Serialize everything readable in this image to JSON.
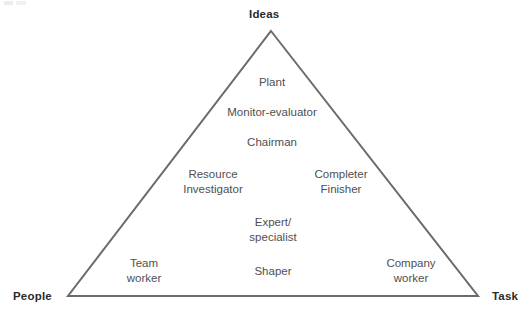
{
  "diagram": {
    "type": "triangle",
    "colors": {
      "background": "#ffffff",
      "line": "#6b6b6b",
      "vertex_label_text": "#2b2b2b",
      "role_label_text": "#4f4f4f"
    },
    "geometry": {
      "apex": [
        271,
        31
      ],
      "bottom_left": [
        68,
        296
      ],
      "bottom_right": [
        478,
        296
      ],
      "stroke_width": 2
    },
    "vertices": [
      {
        "id": "ideas",
        "label": "Ideas",
        "position": "top"
      },
      {
        "id": "people",
        "label": "People",
        "position": "bottom-left"
      },
      {
        "id": "task",
        "label": "Task",
        "position": "bottom-right"
      }
    ],
    "roles": [
      {
        "id": "plant",
        "line1": "Plant",
        "line2": "",
        "x": 272,
        "y": 75
      },
      {
        "id": "monitor-evaluator",
        "line1": "Monitor-evaluator",
        "line2": "",
        "x": 272,
        "y": 105
      },
      {
        "id": "chairman",
        "line1": "Chairman",
        "line2": "",
        "x": 272,
        "y": 135
      },
      {
        "id": "resource-investigator",
        "line1": "Resource",
        "line2": "Investigator",
        "x": 213,
        "y": 167
      },
      {
        "id": "completer-finisher",
        "line1": "Completer",
        "line2": "Finisher",
        "x": 341,
        "y": 167
      },
      {
        "id": "expert-specialist",
        "line1": "Expert/",
        "line2": "specialist",
        "x": 273,
        "y": 215
      },
      {
        "id": "team-worker",
        "line1": "Team",
        "line2": "worker",
        "x": 144,
        "y": 256
      },
      {
        "id": "shaper",
        "line1": "Shaper",
        "line2": "",
        "x": 273,
        "y": 264
      },
      {
        "id": "company-worker",
        "line1": "Company",
        "line2": "worker",
        "x": 411,
        "y": 256
      }
    ]
  }
}
